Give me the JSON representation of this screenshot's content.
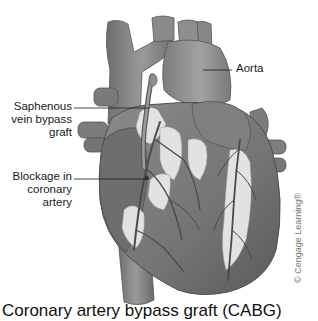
{
  "figure": {
    "title": "Coronary artery bypass graft (CABG)",
    "labels": {
      "aorta": "Aorta",
      "graft": "Saphenous\nvein bypass\ngraft",
      "blockage": "Blockage in\ncoronary\nartery"
    },
    "credit": "© Cengage Learning®",
    "colors": {
      "heart_muscle": "#7a7a7a",
      "heart_shadow": "#5e5e5e",
      "vessel": "#8c8c8c",
      "vessel_dark": "#4e4e4e",
      "fat_tissue": "#e2e2e2",
      "leader_line": "#1a1a1a"
    }
  }
}
